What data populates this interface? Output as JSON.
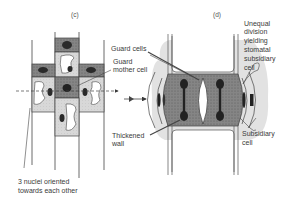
{
  "panels": {
    "c": {
      "label": "(c)"
    },
    "d": {
      "label": "(d)"
    }
  },
  "labels": {
    "guard_cells": "Guard cells",
    "guard_mother_cell_1": "Guard",
    "guard_mother_cell_2": "mother cell",
    "thickened_wall_1": "Thickened",
    "thickened_wall_2": "wall",
    "nuclei_1": "3 nuclei oriented",
    "nuclei_2": "towards each other",
    "unequal_1": "Unequal",
    "unequal_2": "division",
    "unequal_3": "yielding",
    "unequal_4": "stomatal",
    "unequal_5": "subsidiary",
    "unequal_6": "cell",
    "subsidiary_1": "Subsidiary",
    "subsidiary_2": "cell"
  },
  "colors": {
    "line": "#3a3a3a",
    "dark_fill": "#7a7a7a",
    "light_fill": "#d4d4d4",
    "nucleus": "#2a2a2a",
    "background": "#ffffff"
  }
}
